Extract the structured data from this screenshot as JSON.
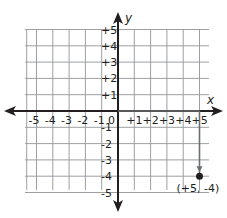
{
  "top_caption": "and a unit down.",
  "chart_data": {
    "type": "scatter",
    "title": "",
    "xlabel": "x",
    "ylabel": "y",
    "xlim": [
      -5,
      5
    ],
    "ylim": [
      -5,
      5
    ],
    "grid": true,
    "x_ticks": [
      "-5",
      "-4",
      "-3",
      "-2",
      "-1",
      "0",
      "+1",
      "+2",
      "+3",
      "+4",
      "+5"
    ],
    "y_ticks": [
      "+5",
      "+4",
      "+3",
      "+2",
      "+1",
      "-1",
      "-2",
      "-3",
      "-4",
      "-5"
    ],
    "points": [
      {
        "x": 5,
        "y": -4,
        "label": "(+5, -4)"
      }
    ],
    "path": [
      {
        "from": [
          0,
          0
        ],
        "to": [
          5,
          0
        ]
      },
      {
        "from": [
          5,
          0
        ],
        "to": [
          5,
          -4
        ]
      }
    ],
    "colors": {
      "axis": "#231f20",
      "grid": "#9d9fa2",
      "path": "#6d6e71"
    }
  }
}
